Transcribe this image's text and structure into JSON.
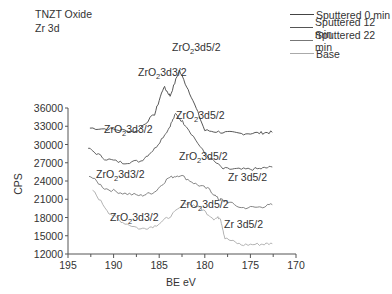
{
  "title_lines": [
    "TNZT Oxide",
    "Zr 3d"
  ],
  "chart_data": {
    "type": "line",
    "xlabel": "BE eV",
    "ylabel": "CPS",
    "xlim": [
      195,
      170
    ],
    "ylim": [
      12000,
      36000
    ],
    "x_ticks": [
      195,
      190,
      185,
      180,
      175,
      170
    ],
    "y_ticks": [
      12000,
      15000,
      18000,
      21000,
      24000,
      27000,
      30000,
      33000,
      36000
    ],
    "x_reversed": true,
    "grid": false,
    "legend_position": "top-right",
    "series": [
      {
        "name": "Sputtered 0 min",
        "color": "#444444",
        "x": [
          192.6,
          190,
          187.5,
          185.5,
          184.5,
          183.8,
          182.8,
          181.5,
          180,
          178,
          176,
          174,
          172.6
        ],
        "y": [
          32700,
          32500,
          32100,
          35000,
          39500,
          38000,
          42200,
          38000,
          32300,
          32000,
          31800,
          31900,
          32000
        ]
      },
      {
        "name": "Sputtered 12 min",
        "color": "#555555",
        "x": [
          192.8,
          191,
          189,
          187,
          185.5,
          184,
          183.2,
          182,
          180,
          178,
          176,
          174,
          172.6
        ],
        "y": [
          29400,
          27700,
          27000,
          27300,
          29300,
          32500,
          35000,
          33000,
          28500,
          26000,
          25900,
          26000,
          26300
        ]
      },
      {
        "name": "Sputtered 22 min",
        "color": "#777777",
        "x": [
          192.7,
          191,
          189,
          187,
          185.5,
          184,
          182.7,
          181,
          179.5,
          178.5,
          178,
          176,
          174,
          172.6
        ],
        "y": [
          25000,
          22800,
          22000,
          21600,
          22200,
          24500,
          25000,
          23500,
          22600,
          21000,
          20900,
          19600,
          19700,
          20100
        ]
      },
      {
        "name": "Base",
        "color": "#aaaaaa",
        "x": [
          192.3,
          190.5,
          189,
          187,
          185.5,
          184,
          182,
          180.5,
          179,
          178.3,
          177.8,
          176,
          174,
          172.6
        ],
        "y": [
          22500,
          18800,
          17200,
          16100,
          16600,
          18000,
          20400,
          19600,
          17800,
          18000,
          14600,
          13500,
          13600,
          13700
        ]
      }
    ],
    "annotations": [
      {
        "text": "ZrO2 3d3/2",
        "series": "Sputtered 0 min"
      },
      {
        "text": "ZrO2 3d5/2",
        "series": "Sputtered 0 min"
      },
      {
        "text": "ZrO2 3d3/2",
        "series": "Sputtered 12 min"
      },
      {
        "text": "ZrO2 3d5/2",
        "series": "Sputtered 12 min"
      },
      {
        "text": "ZrO2 3d3/2",
        "series": "Sputtered 22 min"
      },
      {
        "text": "ZrO2 3d5/2",
        "series": "Sputtered 22 min"
      },
      {
        "text": "Zr 3d5/2",
        "series": "Sputtered 22 min"
      },
      {
        "text": "ZrO2 3d3/2",
        "series": "Base"
      },
      {
        "text": "ZrO2 3d5/2",
        "series": "Base"
      },
      {
        "text": "Zr 3d5/2",
        "series": "Base"
      }
    ]
  }
}
